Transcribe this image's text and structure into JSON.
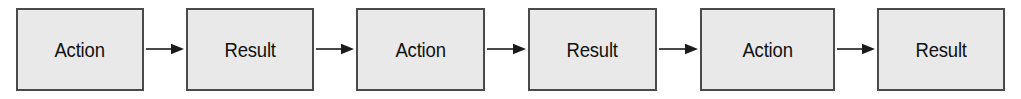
{
  "diagram": {
    "type": "flowchart",
    "orientation": "horizontal",
    "background_color": "#ffffff",
    "node_fill_color": "#e9e9e9",
    "node_border_color": "#4a4a4a",
    "arrow_color": "#1a1a1a",
    "text_color": "#111111",
    "nodes": [
      {
        "id": "node-1",
        "label": "Action",
        "x": 16,
        "width": 128
      },
      {
        "id": "node-2",
        "label": "Result",
        "x": 186,
        "width": 128
      },
      {
        "id": "node-3",
        "label": "Action",
        "x": 356,
        "width": 129
      },
      {
        "id": "node-4",
        "label": "Result",
        "x": 528,
        "width": 129
      },
      {
        "id": "node-5",
        "label": "Action",
        "x": 700,
        "width": 135
      },
      {
        "id": "node-6",
        "label": "Result",
        "x": 877,
        "width": 128
      }
    ],
    "arrows": [
      {
        "id": "arrow-1",
        "from": "node-1",
        "to": "node-2",
        "x": 146,
        "width": 38
      },
      {
        "id": "arrow-2",
        "from": "node-2",
        "to": "node-3",
        "x": 316,
        "width": 38
      },
      {
        "id": "arrow-3",
        "from": "node-3",
        "to": "node-4",
        "x": 487,
        "width": 39
      },
      {
        "id": "arrow-4",
        "from": "node-4",
        "to": "node-5",
        "x": 659,
        "width": 39
      },
      {
        "id": "arrow-5",
        "from": "node-5",
        "to": "node-6",
        "x": 837,
        "width": 38
      }
    ]
  }
}
